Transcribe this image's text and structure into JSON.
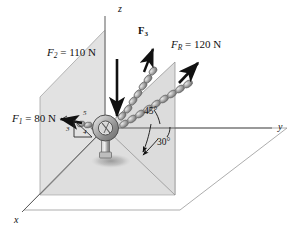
{
  "figure": {
    "background_color": "#ffffff",
    "plane_fill": "#dcdcdc",
    "plane_fill_light": "#e4e4e4",
    "line_color": "#6b6b6b",
    "arrow_color": "#111111",
    "chain_color": "#8f8f8f"
  },
  "axes": [
    {
      "id": "z",
      "label": "z",
      "x": 121,
      "y": 8
    },
    {
      "id": "y",
      "label": "y",
      "x": 278,
      "y": 131
    },
    {
      "id": "x",
      "label": "x",
      "x": 16,
      "y": 222
    }
  ],
  "forces": [
    {
      "id": "F1",
      "symbol": "F",
      "subscript": "1",
      "equals": "=",
      "magnitude": "80",
      "unit": "N",
      "label": "F₁ = 80 N",
      "label_x": 14,
      "label_y": 118,
      "direction": "left, slightly upward in the x–z plane"
    },
    {
      "id": "F2",
      "symbol": "F",
      "subscript": "2",
      "equals": "=",
      "magnitude": "110",
      "unit": "N",
      "label": "F₂ = 110 N",
      "label_x": 48,
      "label_y": 52,
      "direction": "straight down along −z"
    },
    {
      "id": "F3",
      "symbol": "F",
      "subscript": "3",
      "equals": "",
      "magnitude": "",
      "unit": "",
      "label": "F₃",
      "label_x": 139,
      "label_y": 30,
      "direction": "up and to the right, unknown magnitude"
    },
    {
      "id": "FR",
      "symbol": "F",
      "subscript": "R",
      "equals": "=",
      "magnitude": "120",
      "unit": "N",
      "label": "F_R = 120 N",
      "label_x": 172,
      "label_y": 44,
      "direction": "resultant, up and to the right at 45° from horizontal"
    }
  ],
  "angles": [
    {
      "id": "angle-45",
      "label": "45°",
      "x": 146,
      "y": 113,
      "describes": "elevation of F_R above the horizontal plane"
    },
    {
      "id": "angle-30",
      "label": "30°",
      "x": 160,
      "y": 142,
      "describes": "azimuth of the F_R plane from the y axis"
    }
  ],
  "triangle": {
    "id": "slope-triangle-345",
    "describes": "3-4-5 slope triangle for F1",
    "labels": [
      {
        "id": "tri-5",
        "label": "5",
        "x": 84,
        "y": 114
      },
      {
        "id": "tri-3",
        "label": "3",
        "x": 68,
        "y": 131
      },
      {
        "id": "tri-4",
        "label": "4",
        "x": 84,
        "y": 135
      }
    ]
  },
  "objects": [
    {
      "id": "eyebolt",
      "name": "eyebolt",
      "x": 105,
      "y": 128
    },
    {
      "id": "vertical-plane-xz",
      "name": "vertical x–z plane"
    },
    {
      "id": "ground-plane-xy",
      "name": "horizontal x–y ground plane"
    },
    {
      "id": "fr-plane",
      "name": "vertical plane containing F_R"
    }
  ]
}
